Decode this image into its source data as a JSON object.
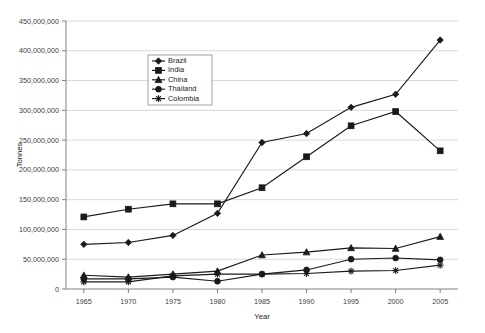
{
  "chart_data": {
    "type": "line",
    "title": "",
    "xlabel": "Year",
    "ylabel": "Tonnes",
    "x": [
      1965,
      1970,
      1975,
      1980,
      1985,
      1990,
      1995,
      2000,
      2005
    ],
    "xtick_labels": [
      "1965",
      "1970",
      "1975",
      "1980",
      "1985",
      "1990",
      "1995",
      "2000",
      "2005"
    ],
    "ytick_labels": [
      "0",
      "50,000,000",
      "100,000,000",
      "150,000,000",
      "200,000,000",
      "250,000,000",
      "300,000,000",
      "350,000,000",
      "400,000,000",
      "450,000,000"
    ],
    "ytick_values": [
      0,
      50000000,
      100000000,
      150000000,
      200000000,
      250000000,
      300000000,
      350000000,
      400000000,
      450000000
    ],
    "ylim": [
      0,
      450000000
    ],
    "xlim": [
      1963,
      2007
    ],
    "grid": true,
    "legend_position": "upper-center-left",
    "series": [
      {
        "name": "Brazil",
        "marker": "diamond",
        "color": "#1a1a1a",
        "values": [
          75000000,
          78000000,
          90000000,
          127000000,
          246000000,
          261000000,
          305000000,
          327000000,
          418000000
        ]
      },
      {
        "name": "India",
        "marker": "square",
        "color": "#1a1a1a",
        "values": [
          121000000,
          134000000,
          143000000,
          143000000,
          170000000,
          222000000,
          274000000,
          298000000,
          232000000
        ]
      },
      {
        "name": "China",
        "marker": "triangle",
        "color": "#1a1a1a",
        "values": [
          23000000,
          20000000,
          25000000,
          30000000,
          57000000,
          62000000,
          69000000,
          68000000,
          88000000
        ]
      },
      {
        "name": "Thailand",
        "marker": "circle",
        "color": "#1a1a1a",
        "values": [
          17000000,
          17000000,
          20000000,
          13000000,
          25000000,
          32000000,
          50000000,
          52000000,
          49000000
        ]
      },
      {
        "name": "Colombia",
        "marker": "star",
        "color": "#1a1a1a",
        "values": [
          12000000,
          12000000,
          22000000,
          25000000,
          25000000,
          26000000,
          30000000,
          31000000,
          40000000
        ]
      }
    ]
  }
}
